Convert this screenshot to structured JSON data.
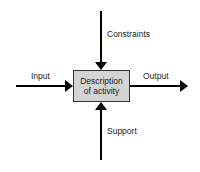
{
  "diagram": {
    "type": "IDEF0 activity box",
    "activity": {
      "line1": "Description",
      "line2": "of activity",
      "fill": "#d4d4d4",
      "border": "#333333"
    },
    "arrows": [
      {
        "name": "input",
        "label": "Input",
        "direction": "left-to-right",
        "target": "box-left"
      },
      {
        "name": "output",
        "label": "Output",
        "direction": "left-to-right",
        "source": "box-right"
      },
      {
        "name": "constraints",
        "label": "Constraints",
        "direction": "top-to-bottom",
        "target": "box-top"
      },
      {
        "name": "support",
        "label": "Support",
        "direction": "bottom-to-top",
        "target": "box-bottom"
      }
    ],
    "arrow_color": "#000000"
  }
}
